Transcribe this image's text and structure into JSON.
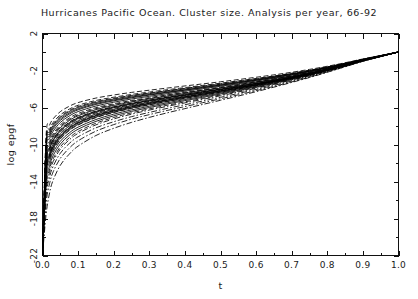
{
  "chart_data": {
    "type": "line",
    "title": "Hurricanes Pacific Ocean. Cluster size. Analysis per year, 66-92",
    "xlabel": "t",
    "ylabel": "log epgf",
    "xlim": [
      0.0,
      1.0
    ],
    "ylim": [
      -22,
      2
    ],
    "grid": false,
    "legend": "none",
    "xticks": [
      "0.0",
      "0.1",
      "0.2",
      "0.3",
      "0.4",
      "0.5",
      "0.6",
      "0.7",
      "0.8",
      "0.9",
      "1.0"
    ],
    "xtick_values": [
      0.0,
      0.1,
      0.2,
      0.3,
      0.4,
      0.5,
      0.6,
      0.7,
      0.8,
      0.9,
      1.0
    ],
    "yticks": [
      "2",
      "-2",
      "-6",
      "-10",
      "-14",
      "-18",
      "-22"
    ],
    "ytick_values": [
      2,
      -2,
      -6,
      -10,
      -14,
      -18,
      -22
    ],
    "minor_tick_step_x": 0.05,
    "minor_tick_step_y": 2,
    "x": [
      0.0,
      0.01,
      0.02,
      0.03,
      0.05,
      0.075,
      0.1,
      0.15,
      0.2,
      0.25,
      0.3,
      0.35,
      0.4,
      0.45,
      0.5,
      0.55,
      0.6,
      0.65,
      0.7,
      0.75,
      0.8,
      0.85,
      0.9,
      0.95,
      1.0
    ],
    "series": [
      {
        "name": "1966",
        "dash": "solid",
        "values": [
          -22.0,
          -12.6,
          -10.9,
          -9.95,
          -8.85,
          -8.0,
          -7.45,
          -6.7,
          -6.2,
          -5.78,
          -5.42,
          -5.08,
          -4.76,
          -4.45,
          -4.14,
          -3.83,
          -3.5,
          -3.15,
          -2.78,
          -2.38,
          -1.92,
          -1.42,
          -0.9,
          -0.45,
          0.0
        ]
      },
      {
        "name": "1967",
        "dash": "dash",
        "values": [
          -22.0,
          -13.4,
          -11.6,
          -10.6,
          -9.4,
          -8.5,
          -7.9,
          -7.1,
          -6.55,
          -6.1,
          -5.72,
          -5.36,
          -5.02,
          -4.68,
          -4.34,
          -4.0,
          -3.64,
          -3.26,
          -2.86,
          -2.44,
          -1.96,
          -1.45,
          -0.92,
          -0.46,
          0.0
        ]
      },
      {
        "name": "1968",
        "dash": "solid",
        "values": [
          -22.0,
          -14.2,
          -12.3,
          -11.2,
          -9.95,
          -9.0,
          -8.35,
          -7.5,
          -6.9,
          -6.42,
          -6.0,
          -5.62,
          -5.26,
          -4.9,
          -4.54,
          -4.16,
          -3.78,
          -3.38,
          -2.95,
          -2.5,
          -2.0,
          -1.48,
          -0.94,
          -0.47,
          0.0
        ]
      },
      {
        "name": "1969",
        "dash": "dashdot",
        "values": [
          -22.0,
          -15.0,
          -13.0,
          -11.85,
          -10.5,
          -9.5,
          -8.8,
          -7.88,
          -7.24,
          -6.72,
          -6.28,
          -5.88,
          -5.5,
          -5.12,
          -4.73,
          -4.33,
          -3.92,
          -3.5,
          -3.04,
          -2.57,
          -2.05,
          -1.51,
          -0.96,
          -0.48,
          0.0
        ]
      },
      {
        "name": "1970",
        "dash": "solid",
        "values": [
          -22.0,
          -12.0,
          -10.4,
          -9.5,
          -8.45,
          -7.65,
          -7.12,
          -6.42,
          -5.95,
          -5.56,
          -5.22,
          -4.9,
          -4.6,
          -4.3,
          -4.0,
          -3.7,
          -3.39,
          -3.05,
          -2.69,
          -2.3,
          -1.86,
          -1.38,
          -0.88,
          -0.44,
          0.0
        ]
      },
      {
        "name": "1971",
        "dash": "dash",
        "values": [
          -22.0,
          -11.2,
          -9.7,
          -8.85,
          -7.88,
          -7.15,
          -6.65,
          -6.02,
          -5.6,
          -5.24,
          -4.93,
          -4.64,
          -4.36,
          -4.08,
          -3.8,
          -3.52,
          -3.22,
          -2.9,
          -2.56,
          -2.19,
          -1.78,
          -1.32,
          -0.85,
          -0.42,
          0.0
        ]
      },
      {
        "name": "1972",
        "dash": "solid",
        "values": [
          -22.0,
          -10.5,
          -9.1,
          -8.3,
          -7.4,
          -6.72,
          -6.25,
          -5.67,
          -5.28,
          -4.95,
          -4.66,
          -4.39,
          -4.13,
          -3.87,
          -3.61,
          -3.34,
          -3.06,
          -2.76,
          -2.44,
          -2.09,
          -1.7,
          -1.27,
          -0.82,
          -0.41,
          0.0
        ]
      },
      {
        "name": "1973",
        "dash": "dash",
        "values": [
          -22.0,
          -9.6,
          -8.35,
          -7.62,
          -6.8,
          -6.18,
          -5.76,
          -5.24,
          -4.89,
          -4.59,
          -4.33,
          -4.08,
          -3.85,
          -3.61,
          -3.37,
          -3.12,
          -2.86,
          -2.59,
          -2.29,
          -1.97,
          -1.61,
          -1.21,
          -0.78,
          -0.39,
          0.0
        ]
      },
      {
        "name": "1974",
        "dash": "solid",
        "values": [
          -22.0,
          -13.0,
          -11.25,
          -10.3,
          -9.15,
          -8.3,
          -7.7,
          -6.92,
          -6.4,
          -5.96,
          -5.58,
          -5.23,
          -4.9,
          -4.57,
          -4.25,
          -3.92,
          -3.57,
          -3.2,
          -2.81,
          -2.4,
          -1.94,
          -1.44,
          -0.92,
          -0.46,
          0.0
        ]
      },
      {
        "name": "1975",
        "dash": "dash",
        "values": [
          -22.0,
          -12.3,
          -10.65,
          -9.75,
          -8.65,
          -7.85,
          -7.3,
          -6.58,
          -6.1,
          -5.69,
          -5.34,
          -5.01,
          -4.7,
          -4.39,
          -4.08,
          -3.77,
          -3.45,
          -3.1,
          -2.73,
          -2.34,
          -1.89,
          -1.4,
          -0.9,
          -0.45,
          0.0
        ]
      },
      {
        "name": "1976",
        "dash": "solid",
        "values": [
          -22.0,
          -11.6,
          -10.05,
          -9.2,
          -8.18,
          -7.42,
          -6.9,
          -6.23,
          -5.78,
          -5.4,
          -5.08,
          -4.77,
          -4.48,
          -4.19,
          -3.9,
          -3.61,
          -3.3,
          -2.97,
          -2.62,
          -2.24,
          -1.82,
          -1.35,
          -0.87,
          -0.43,
          0.0
        ]
      },
      {
        "name": "1977",
        "dash": "dashdot",
        "values": [
          -22.0,
          -16.4,
          -14.2,
          -12.95,
          -11.5,
          -10.4,
          -9.6,
          -8.56,
          -7.85,
          -7.26,
          -6.77,
          -6.32,
          -5.9,
          -5.48,
          -5.06,
          -4.63,
          -4.18,
          -3.72,
          -3.23,
          -2.72,
          -2.16,
          -1.58,
          -1.0,
          -0.5,
          0.0
        ]
      },
      {
        "name": "1978",
        "dash": "solid",
        "values": [
          -22.0,
          -10.0,
          -8.7,
          -7.94,
          -7.08,
          -6.44,
          -6.0,
          -5.45,
          -5.08,
          -4.77,
          -4.5,
          -4.24,
          -3.99,
          -3.74,
          -3.49,
          -3.23,
          -2.96,
          -2.67,
          -2.36,
          -2.03,
          -1.65,
          -1.24,
          -0.8,
          -0.4,
          0.0
        ]
      },
      {
        "name": "1979",
        "dash": "dash",
        "values": [
          -22.0,
          -14.6,
          -12.65,
          -11.55,
          -10.25,
          -9.28,
          -8.6,
          -7.7,
          -7.08,
          -6.58,
          -6.15,
          -5.76,
          -5.39,
          -5.02,
          -4.64,
          -4.25,
          -3.85,
          -3.44,
          -3.0,
          -2.54,
          -2.03,
          -1.5,
          -0.95,
          -0.47,
          0.0
        ]
      },
      {
        "name": "1980",
        "dash": "solid",
        "values": [
          -22.0,
          -13.7,
          -11.9,
          -10.85,
          -9.65,
          -8.75,
          -8.12,
          -7.3,
          -6.72,
          -6.26,
          -5.86,
          -5.49,
          -5.14,
          -4.79,
          -4.44,
          -4.08,
          -3.71,
          -3.32,
          -2.9,
          -2.47,
          -1.98,
          -1.47,
          -0.94,
          -0.47,
          0.0
        ]
      },
      {
        "name": "1981",
        "dash": "dash",
        "values": [
          -22.0,
          -9.1,
          -7.9,
          -7.22,
          -6.45,
          -5.87,
          -5.47,
          -4.98,
          -4.65,
          -4.37,
          -4.13,
          -3.9,
          -3.67,
          -3.45,
          -3.22,
          -2.98,
          -2.73,
          -2.47,
          -2.19,
          -1.88,
          -1.54,
          -1.16,
          -0.75,
          -0.38,
          0.0
        ]
      },
      {
        "name": "1982",
        "dash": "solid",
        "values": [
          -22.0,
          -12.9,
          -11.15,
          -10.2,
          -9.08,
          -8.22,
          -7.63,
          -6.86,
          -6.34,
          -5.91,
          -5.54,
          -5.19,
          -4.87,
          -4.54,
          -4.22,
          -3.89,
          -3.55,
          -3.18,
          -2.79,
          -2.38,
          -1.92,
          -1.43,
          -0.91,
          -0.45,
          0.0
        ]
      },
      {
        "name": "1983",
        "dash": "dash",
        "values": [
          -22.0,
          -11.9,
          -10.3,
          -9.42,
          -8.38,
          -7.6,
          -7.07,
          -6.38,
          -5.92,
          -5.53,
          -5.2,
          -4.89,
          -4.59,
          -4.29,
          -4.0,
          -3.7,
          -3.39,
          -3.05,
          -2.69,
          -2.3,
          -1.86,
          -1.38,
          -0.88,
          -0.44,
          0.0
        ]
      },
      {
        "name": "1984",
        "dash": "solid",
        "values": [
          -22.0,
          -10.8,
          -9.37,
          -8.56,
          -7.62,
          -6.92,
          -6.44,
          -5.84,
          -5.43,
          -5.08,
          -4.79,
          -4.51,
          -4.24,
          -3.97,
          -3.7,
          -3.43,
          -3.14,
          -2.83,
          -2.5,
          -2.14,
          -1.74,
          -1.3,
          -0.84,
          -0.42,
          0.0
        ]
      },
      {
        "name": "1985",
        "dash": "dashdot",
        "values": [
          -22.0,
          -15.6,
          -13.5,
          -12.35,
          -10.95,
          -9.9,
          -9.17,
          -8.2,
          -7.54,
          -6.99,
          -6.53,
          -6.1,
          -5.7,
          -5.3,
          -4.9,
          -4.48,
          -4.05,
          -3.61,
          -3.14,
          -2.65,
          -2.11,
          -1.55,
          -0.98,
          -0.49,
          0.0
        ]
      },
      {
        "name": "1986",
        "dash": "solid",
        "values": [
          -22.0,
          -12.15,
          -10.5,
          -9.6,
          -8.55,
          -7.75,
          -7.2,
          -6.5,
          -6.02,
          -5.62,
          -5.28,
          -4.96,
          -4.66,
          -4.36,
          -4.06,
          -3.75,
          -3.43,
          -3.09,
          -2.72,
          -2.33,
          -1.88,
          -1.4,
          -0.89,
          -0.44,
          0.0
        ]
      },
      {
        "name": "1987",
        "dash": "dash",
        "values": [
          -22.0,
          -9.85,
          -8.55,
          -7.8,
          -6.96,
          -6.33,
          -5.9,
          -5.36,
          -5.0,
          -4.69,
          -4.43,
          -4.18,
          -3.93,
          -3.69,
          -3.44,
          -3.18,
          -2.92,
          -2.63,
          -2.32,
          -1.99,
          -1.62,
          -1.22,
          -0.79,
          -0.39,
          0.0
        ]
      },
      {
        "name": "1988",
        "dash": "solid",
        "values": [
          -22.0,
          -13.2,
          -11.45,
          -10.45,
          -9.3,
          -8.43,
          -7.83,
          -7.04,
          -6.5,
          -6.06,
          -5.68,
          -5.33,
          -4.99,
          -4.66,
          -4.33,
          -3.99,
          -3.63,
          -3.26,
          -2.86,
          -2.44,
          -1.96,
          -1.45,
          -0.93,
          -0.46,
          0.0
        ]
      },
      {
        "name": "1989",
        "dash": "dash",
        "values": [
          -22.0,
          -11.4,
          -9.88,
          -9.03,
          -8.04,
          -7.3,
          -6.79,
          -6.13,
          -5.69,
          -5.32,
          -5.0,
          -4.7,
          -4.42,
          -4.13,
          -3.85,
          -3.56,
          -3.26,
          -2.93,
          -2.59,
          -2.22,
          -1.8,
          -1.34,
          -0.86,
          -0.43,
          0.0
        ]
      },
      {
        "name": "1990",
        "dash": "solid",
        "values": [
          -22.0,
          -10.25,
          -8.9,
          -8.13,
          -7.25,
          -6.59,
          -6.14,
          -5.57,
          -5.19,
          -4.87,
          -4.6,
          -4.34,
          -4.09,
          -3.83,
          -3.57,
          -3.3,
          -3.03,
          -2.73,
          -2.41,
          -2.07,
          -1.68,
          -1.26,
          -0.81,
          -0.4,
          0.0
        ]
      },
      {
        "name": "1991",
        "dash": "dash",
        "values": [
          -22.0,
          -12.75,
          -11.05,
          -10.1,
          -9.0,
          -8.15,
          -7.57,
          -6.8,
          -6.29,
          -5.86,
          -5.5,
          -5.16,
          -4.84,
          -4.51,
          -4.19,
          -3.86,
          -3.52,
          -3.16,
          -2.77,
          -2.36,
          -1.9,
          -1.41,
          -0.9,
          -0.45,
          0.0
        ]
      },
      {
        "name": "1992",
        "dash": "dashdot",
        "values": [
          -22.0,
          -17.6,
          -15.2,
          -13.85,
          -12.25,
          -11.05,
          -10.18,
          -9.03,
          -8.25,
          -7.61,
          -7.07,
          -6.58,
          -6.12,
          -5.67,
          -5.22,
          -4.76,
          -4.29,
          -3.8,
          -3.29,
          -2.76,
          -2.19,
          -1.6,
          -1.01,
          -0.5,
          0.0
        ]
      }
    ]
  }
}
